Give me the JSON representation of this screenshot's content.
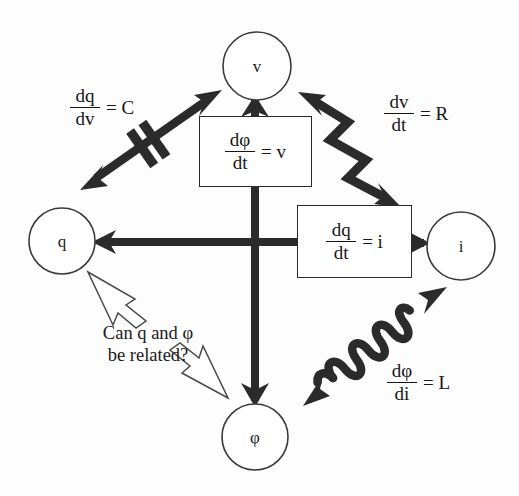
{
  "diagram": {
    "colors": {
      "ink": "#1a1a1a",
      "heavy_stroke": "#2b2b2b",
      "node_stroke": "#3a3a3a",
      "background": "#fdfdfd",
      "callout_stroke": "#4a4a4a"
    }
  },
  "nodes": [
    {
      "id": "v",
      "label": "v",
      "cx": 257,
      "cy": 66,
      "r": 34
    },
    {
      "id": "q",
      "label": "q",
      "cx": 62,
      "cy": 241,
      "r": 33
    },
    {
      "id": "i",
      "label": "i",
      "cx": 461,
      "cy": 246,
      "r": 34
    },
    {
      "id": "phi",
      "label": "φ",
      "cx": 255,
      "cy": 437,
      "r": 33
    }
  ],
  "boxes": [
    {
      "id": "dphi-dt",
      "numerator": "dφ",
      "denominator": "dt",
      "equals": "= v",
      "x": 199,
      "y": 116,
      "w": 113,
      "h": 71
    },
    {
      "id": "dq-dt",
      "numerator": "dq",
      "denominator": "dt",
      "equals": "= i",
      "x": 297,
      "y": 205,
      "w": 115,
      "h": 73
    }
  ],
  "element_labels": [
    {
      "id": "capacitance",
      "element": "capacitor",
      "numerator": "dq",
      "denominator": "dv",
      "equals": "= C",
      "x": 70,
      "y": 86
    },
    {
      "id": "resistance",
      "element": "resistor",
      "numerator": "dv",
      "denominator": "dt",
      "equals": "= R",
      "x": 384,
      "y": 92
    },
    {
      "id": "inductance",
      "element": "inductor",
      "numerator": "dφ",
      "denominator": "di",
      "equals": "= L",
      "x": 387,
      "y": 361
    }
  ],
  "callout": {
    "id": "memristor-question",
    "line1": "Can q and φ",
    "line2": "be related?",
    "x": 148,
    "y": 323
  },
  "connectors": [
    {
      "id": "phi-to-v-arrow",
      "type": "plain-arrow",
      "direction": "up",
      "from": "dphi-dt-box",
      "to": "v"
    },
    {
      "id": "center-to-phi-arrow",
      "type": "plain-arrow",
      "direction": "down",
      "from": "center",
      "to": "phi"
    },
    {
      "id": "dq-dt-to-q-arrow",
      "type": "plain-arrow",
      "direction": "left",
      "from": "dq-dt-box",
      "to": "q"
    },
    {
      "id": "dq-dt-to-i-arrow",
      "type": "plain-arrow",
      "direction": "right",
      "from": "dq-dt-box",
      "to": "i"
    },
    {
      "id": "capacitor-arrow",
      "type": "capacitor",
      "from": "q",
      "to": "v"
    },
    {
      "id": "resistor-arrow",
      "type": "resistor",
      "from": "v",
      "to": "i"
    },
    {
      "id": "inductor-arrow",
      "type": "inductor",
      "from": "phi",
      "to": "i"
    }
  ]
}
